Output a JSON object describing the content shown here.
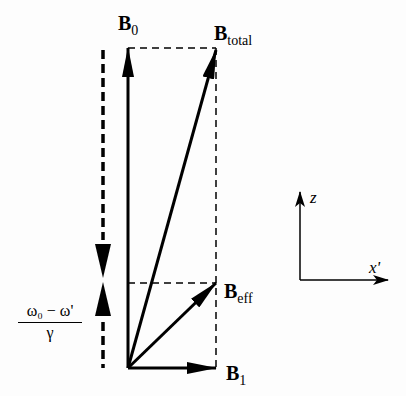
{
  "labels": {
    "b0": {
      "main": "B",
      "sub": "0"
    },
    "btotal": {
      "main": "B",
      "sub": "total"
    },
    "beff": {
      "main": "B",
      "sub": "eff"
    },
    "b1": {
      "main": "B",
      "sub": "1"
    },
    "axis_z": "z",
    "axis_x": "x'",
    "fraction_num": "ω₀ − ω'",
    "fraction_den": "γ"
  },
  "colors": {
    "stroke": "#000000",
    "background": "#fdfdfd"
  }
}
